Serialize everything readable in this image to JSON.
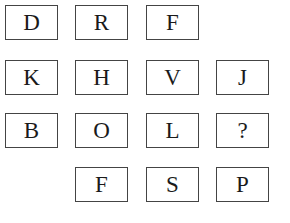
{
  "grid": {
    "rows": [
      [
        "D",
        "R",
        "F",
        ""
      ],
      [
        "K",
        "H",
        "V",
        "J"
      ],
      [
        "B",
        "O",
        "L",
        "?"
      ],
      [
        "",
        "F",
        "S",
        "P"
      ]
    ]
  }
}
